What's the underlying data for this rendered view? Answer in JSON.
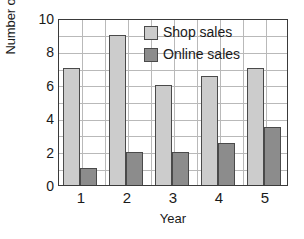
{
  "chart_data": {
    "type": "bar",
    "title": "",
    "xlabel": "Year",
    "ylabel": "Number of sales (thousands)",
    "categories": [
      "1",
      "2",
      "3",
      "4",
      "5"
    ],
    "series": [
      {
        "name": "Shop sales",
        "color": "#cccccc",
        "values": [
          7,
          9,
          6,
          6.5,
          7
        ]
      },
      {
        "name": "Online sales",
        "color": "#8c8c8c",
        "values": [
          1,
          2,
          2,
          2.5,
          3.5
        ]
      }
    ],
    "ylim": [
      0,
      10
    ],
    "yticks": [
      "0",
      "2",
      "4",
      "6",
      "8",
      "10"
    ],
    "ytick_values": [
      0,
      2,
      4,
      6,
      8,
      10
    ],
    "gridlines_y": [
      1,
      2,
      3,
      4,
      5,
      6,
      7,
      8,
      9
    ],
    "grid": true,
    "legend_position": "top-right-inside"
  },
  "axis": {
    "y_title": "Number of sales (thousands)",
    "x_title": "Year"
  },
  "legend": {
    "entries": [
      {
        "label": "Shop sales"
      },
      {
        "label": "Online sales"
      }
    ]
  }
}
